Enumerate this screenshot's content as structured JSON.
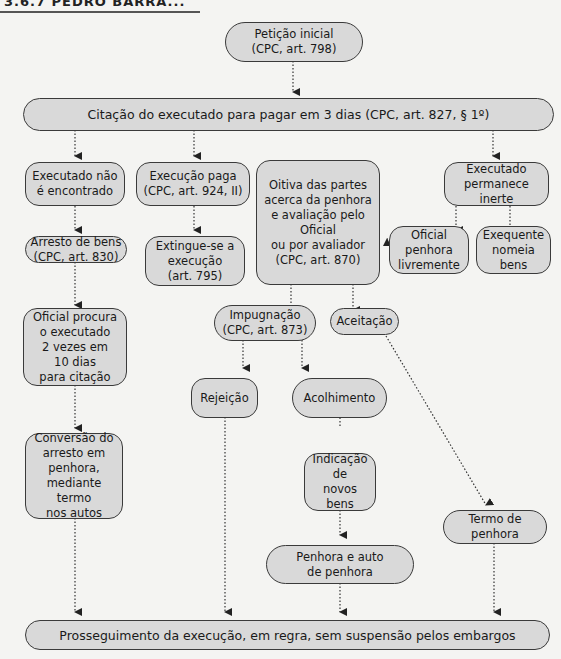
{
  "header": {
    "title": "3.6.7  PEDRO BARRA..."
  },
  "colors": {
    "node_fill": "#d9d9d9",
    "node_border": "#3a3a3a",
    "edge": "#333333",
    "background": "#f4f4f2"
  },
  "nodes": {
    "peticao": "Petição inicial\n(CPC, art. 798)",
    "citacao": "Citação do executado para pagar em 3 dias (CPC, art. 827, § 1º)",
    "nao_encontrado": "Executado não\né encontrado",
    "paga": "Execução paga\n(CPC, art. 924, II)",
    "oitiva": "Oitiva das partes\nacerca da penhora\ne avaliação pelo\nOficial\nou por avaliador\n(CPC, art. 870)",
    "inerte": "Executado\npermanece inerte",
    "arresto": "Arresto de bens\n(CPC, art. 830)",
    "extingue": "Extingue-se a\nexecução\n(art. 795)",
    "oficial_penhora": "Oficial\npenhora\nlivremente",
    "exequente_nomeia": "Exequente\nnomeia\nbens",
    "oficial_procura": "Oficial procura\no executado\n2 vezes em\n10 dias\npara citação",
    "impugnacao": "Impugnação\n(CPC, art. 873)",
    "aceitacao": "Aceitação",
    "rejeicao": "Rejeição",
    "acolhimento": "Acolhimento",
    "conversao": "Conversão do\narresto em\npenhora,\nmediante termo\nnos autos",
    "indicacao": "Indicação\nde\nnovos bens",
    "termo": "Termo de\npenhora",
    "penhora_auto": "Penhora e auto\nde penhora",
    "prosseguimento": "Prosseguimento da execução, em regra, sem suspensão pelos embargos"
  }
}
